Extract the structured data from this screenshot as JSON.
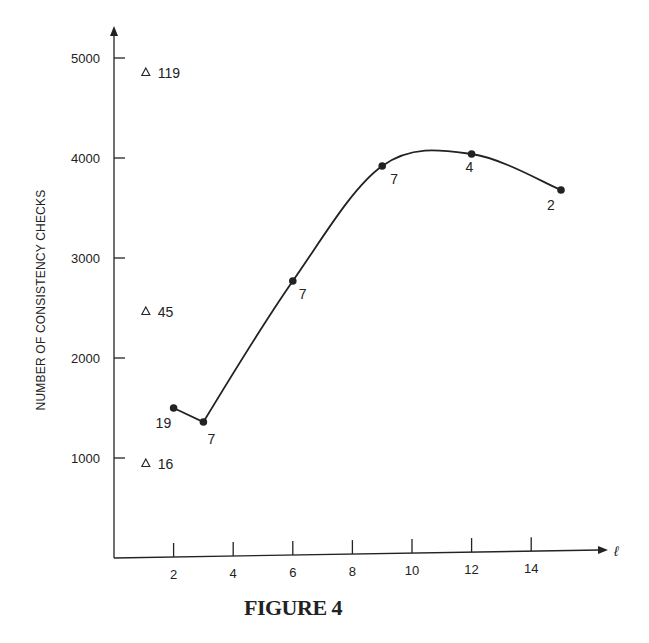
{
  "caption": "FIGURE 4",
  "chart_data": {
    "type": "line",
    "title": "",
    "xlabel": "ℓ",
    "ylabel": "NUMBER OF CONSISTENCY CHECKS",
    "xlim": [
      0,
      16
    ],
    "ylim": [
      0,
      5300
    ],
    "x_ticks": [
      2,
      4,
      6,
      8,
      10,
      12,
      14
    ],
    "y_ticks": [
      1000,
      2000,
      3000,
      4000,
      5000
    ],
    "grid": false,
    "series": [
      {
        "name": "circles",
        "marker": "filled-circle",
        "x": [
          2,
          3,
          6,
          9,
          12,
          15
        ],
        "values": [
          1500,
          1360,
          2770,
          3920,
          4040,
          3680
        ],
        "point_labels": [
          "19",
          "7",
          "7",
          "7",
          "4",
          "2"
        ]
      },
      {
        "name": "triangles",
        "marker": "open-triangle",
        "x": [
          1,
          1,
          1
        ],
        "values": [
          4860,
          2470,
          950
        ],
        "point_labels": [
          "119",
          "45",
          "16"
        ]
      }
    ]
  }
}
